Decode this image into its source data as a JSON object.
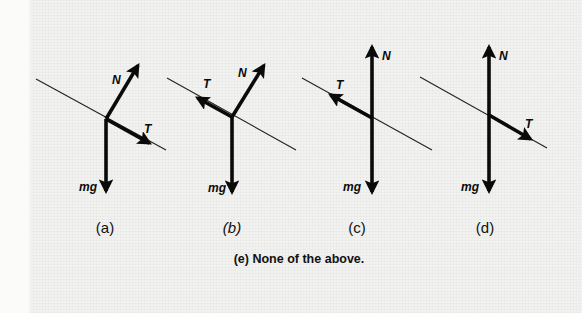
{
  "figure": {
    "type": "free-body diagrams on an incline",
    "options": [
      {
        "id": "a",
        "label": "(a)",
        "italic": false,
        "incline": {
          "x1": 36,
          "y1": 79,
          "x2": 166,
          "y2": 150
        },
        "origin": {
          "x": 106,
          "y": 119
        },
        "vectors": [
          {
            "name": "N",
            "tip": {
              "x": 140,
              "y": 62
            },
            "label_pos": {
              "x": 112,
              "y": 84
            }
          },
          {
            "name": "T",
            "tip": {
              "x": 153,
              "y": 145
            },
            "label_pos": {
              "x": 144,
              "y": 133
            }
          },
          {
            "name": "mg",
            "tip": {
              "x": 106,
              "y": 195
            },
            "label_pos": {
              "x": 79,
              "y": 191
            }
          }
        ],
        "label_pos": {
          "x": 105,
          "y": 227
        }
      },
      {
        "id": "b",
        "label": "(b)",
        "italic": true,
        "incline": {
          "x1": 167,
          "y1": 78,
          "x2": 296,
          "y2": 150
        },
        "origin": {
          "x": 232,
          "y": 117
        },
        "vectors": [
          {
            "name": "T",
            "tip": {
              "x": 194,
              "y": 96
            },
            "label_pos": {
              "x": 203,
              "y": 88
            }
          },
          {
            "name": "N",
            "tip": {
              "x": 266,
              "y": 62
            },
            "label_pos": {
              "x": 238,
              "y": 77
            }
          },
          {
            "name": "mg",
            "tip": {
              "x": 232,
              "y": 196
            },
            "label_pos": {
              "x": 208,
              "y": 192
            }
          }
        ],
        "label_pos": {
          "x": 232,
          "y": 227
        }
      },
      {
        "id": "c",
        "label": "(c)",
        "italic": false,
        "incline": {
          "x1": 302,
          "y1": 78,
          "x2": 432,
          "y2": 150
        },
        "origin": {
          "x": 372,
          "y": 118
        },
        "vectors": [
          {
            "name": "N",
            "tip": {
              "x": 372,
              "y": 43
            },
            "label_pos": {
              "x": 382,
              "y": 60
            }
          },
          {
            "name": "T",
            "tip": {
              "x": 327,
              "y": 93
            },
            "label_pos": {
              "x": 336,
              "y": 89
            }
          },
          {
            "name": "mg",
            "tip": {
              "x": 372,
              "y": 196
            },
            "label_pos": {
              "x": 343,
              "y": 191
            }
          }
        ],
        "label_pos": {
          "x": 357,
          "y": 227
        }
      },
      {
        "id": "d",
        "label": "(d)",
        "italic": false,
        "incline": {
          "x1": 420,
          "y1": 77,
          "x2": 547,
          "y2": 148
        },
        "origin": {
          "x": 489,
          "y": 115
        },
        "vectors": [
          {
            "name": "N",
            "tip": {
              "x": 489,
              "y": 43
            },
            "label_pos": {
              "x": 499,
              "y": 60
            }
          },
          {
            "name": "T",
            "tip": {
              "x": 534,
              "y": 141
            },
            "label_pos": {
              "x": 525,
              "y": 128
            }
          },
          {
            "name": "mg",
            "tip": {
              "x": 489,
              "y": 195
            },
            "label_pos": {
              "x": 461,
              "y": 191
            }
          }
        ],
        "label_pos": {
          "x": 485,
          "y": 227
        }
      }
    ],
    "option_e": {
      "label": "(e) None of the above.",
      "pos": {
        "x": 299,
        "y": 259
      }
    },
    "colors": {
      "ink": "#0a0a0a",
      "background": "#f2f2f0"
    }
  }
}
